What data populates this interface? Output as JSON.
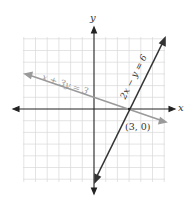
{
  "diagram": {
    "axes": {
      "x_label": "x",
      "y_label": "y",
      "range": [
        -6,
        6
      ]
    },
    "lines": [
      {
        "equation": "x + 3y = 3",
        "color": "#9a9a9a"
      },
      {
        "equation": "2x − y = 6",
        "color": "#333333"
      }
    ],
    "intersection_label": "(3, 0)",
    "colors": {
      "grid": "#d8d8d8",
      "axis": "#222222"
    }
  }
}
